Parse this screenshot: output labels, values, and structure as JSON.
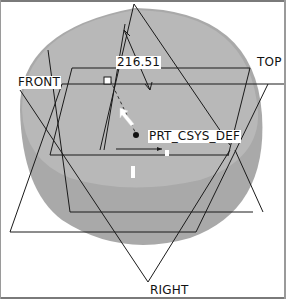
{
  "viewport": {
    "background": "#ffffff",
    "model_fill_side": "#a8a8a8",
    "model_fill_top": "#b9b9b9",
    "line_color": "#1a1a1a"
  },
  "datum_planes": {
    "front": "FRONT",
    "top": "TOP",
    "right": "RIGHT"
  },
  "coordinate_system": {
    "label": "PRT_CSYS_DEF"
  },
  "dimension": {
    "value": "216.51"
  }
}
